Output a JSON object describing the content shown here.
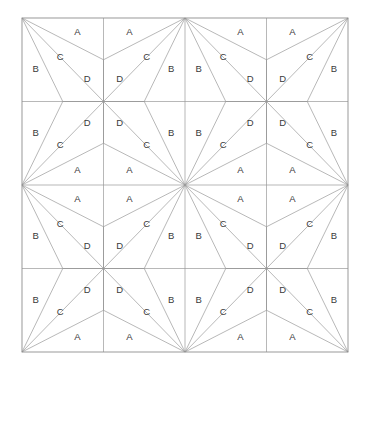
{
  "figure": {
    "background_color": "#ffffff",
    "line_color": "#9a9a9a",
    "border_color": "#8e8e8e",
    "label_color": "#3a3a3a",
    "label_font_size": 9.5
  },
  "grid": {
    "columns": 4,
    "rows": 4,
    "origin_x": 22,
    "origin_y": 18,
    "cell_width": 81.5,
    "cell_height": 83.5,
    "total_width": 326,
    "total_height": 334,
    "region_names": [
      "A",
      "B",
      "C",
      "D"
    ],
    "orientation_note": "Each cell's three divider lines radiate from one corner; orientation mirrors in a 2x2 repeating block.",
    "cells": [
      {
        "row": 0,
        "col": 0,
        "apex": "top-left",
        "labels": {
          "A": "A",
          "B": "B",
          "C": "C",
          "D": "D"
        }
      },
      {
        "row": 0,
        "col": 1,
        "apex": "top-right",
        "labels": {
          "A": "A",
          "B": "B",
          "C": "C",
          "D": "D"
        }
      },
      {
        "row": 0,
        "col": 2,
        "apex": "top-left",
        "labels": {
          "A": "A",
          "B": "B",
          "C": "C",
          "D": "D"
        }
      },
      {
        "row": 0,
        "col": 3,
        "apex": "top-right",
        "labels": {
          "A": "A",
          "B": "B",
          "C": "C",
          "D": "D"
        }
      },
      {
        "row": 1,
        "col": 0,
        "apex": "bottom-left",
        "labels": {
          "A": "A",
          "B": "B",
          "C": "C",
          "D": "D"
        }
      },
      {
        "row": 1,
        "col": 1,
        "apex": "bottom-right",
        "labels": {
          "A": "A",
          "B": "B",
          "C": "C",
          "D": "D"
        }
      },
      {
        "row": 1,
        "col": 2,
        "apex": "bottom-left",
        "labels": {
          "A": "A",
          "B": "B",
          "C": "C",
          "D": "D"
        }
      },
      {
        "row": 1,
        "col": 3,
        "apex": "bottom-right",
        "labels": {
          "A": "A",
          "B": "B",
          "C": "C",
          "D": "D"
        }
      },
      {
        "row": 2,
        "col": 0,
        "apex": "top-left",
        "labels": {
          "A": "A",
          "B": "B",
          "C": "C",
          "D": "D"
        }
      },
      {
        "row": 2,
        "col": 1,
        "apex": "top-right",
        "labels": {
          "A": "A",
          "B": "B",
          "C": "C",
          "D": "D"
        }
      },
      {
        "row": 2,
        "col": 2,
        "apex": "top-left",
        "labels": {
          "A": "A",
          "B": "B",
          "C": "C",
          "D": "D"
        }
      },
      {
        "row": 2,
        "col": 3,
        "apex": "top-right",
        "labels": {
          "A": "A",
          "B": "B",
          "C": "C",
          "D": "D"
        }
      },
      {
        "row": 3,
        "col": 0,
        "apex": "bottom-left",
        "labels": {
          "A": "A",
          "B": "B",
          "C": "C",
          "D": "D"
        }
      },
      {
        "row": 3,
        "col": 1,
        "apex": "bottom-right",
        "labels": {
          "A": "A",
          "B": "B",
          "C": "C",
          "D": "D"
        }
      },
      {
        "row": 3,
        "col": 2,
        "apex": "bottom-left",
        "labels": {
          "A": "A",
          "B": "B",
          "C": "C",
          "D": "D"
        }
      },
      {
        "row": 3,
        "col": 3,
        "apex": "bottom-right",
        "labels": {
          "A": "A",
          "B": "B",
          "C": "C",
          "D": "D"
        }
      }
    ]
  }
}
